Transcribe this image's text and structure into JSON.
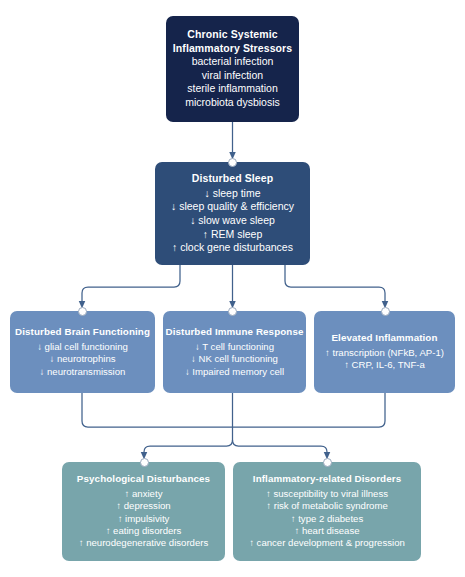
{
  "diagram": {
    "background_color": "#ffffff",
    "edge_color": "#41618c",
    "joint_color": "#ffffff"
  },
  "nodes": {
    "stressors": {
      "id": "chronic-systemic-inflammatory-stressors",
      "color": "#15244b",
      "title_line_1": "Chronic Systemic",
      "title_line_2": "Inflammatory Stressors",
      "items": [
        "bacterial infection",
        "viral infection",
        "sterile inflammation",
        "microbiota dysbiosis"
      ]
    },
    "sleep": {
      "id": "disturbed-sleep",
      "color": "#2e4d78",
      "title": "Disturbed Sleep",
      "items": [
        "↓ sleep time",
        "↓ sleep quality & efficiency",
        "↓ slow wave sleep",
        "↑ REM sleep",
        "↑ clock gene disturbances"
      ]
    },
    "brain": {
      "id": "disturbed-brain-functioning",
      "color": "#6c8fbe",
      "title": "Disturbed Brain Functioning",
      "items": [
        "↓ glial cell functioning",
        "↓ neurotrophins",
        "↓ neurotransmission"
      ]
    },
    "immune": {
      "id": "disturbed-immune-response",
      "color": "#6c8fbe",
      "title": "Disturbed Immune Response",
      "items": [
        "↓ T cell functioning",
        "↓ NK cell functioning",
        "↓ Impaired memory cell"
      ]
    },
    "inflammation": {
      "id": "elevated-inflammation",
      "color": "#6c8fbe",
      "title": "Elevated Inflammation",
      "items": [
        "↑ transcription (NFkB, AP-1)",
        "↑ CRP, IL-6, TNF-a"
      ]
    },
    "psychological": {
      "id": "psychological-disturbances",
      "color": "#78a5ab",
      "title": "Psychological Disturbances",
      "items": [
        "↑ anxiety",
        "↑ depression",
        "↑ impulsivity",
        "↑ eating disorders",
        "↑ neurodegenerative disorders"
      ]
    },
    "inflammatory_disorders": {
      "id": "inflammatory-related-disorders",
      "color": "#78a5ab",
      "title": "Inflammatory-related Disorders",
      "items": [
        "↑ susceptibility to viral illness",
        "↑ risk of metabolic syndrome",
        "↑ type 2 diabetes",
        "↑ heart disease",
        "↑ cancer development & progression"
      ]
    }
  }
}
